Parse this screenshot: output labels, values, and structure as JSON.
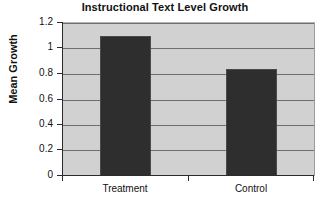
{
  "chart_data": {
    "type": "bar",
    "title": "Instructional Text Level Growth",
    "xlabel": "",
    "ylabel": "Mean Growth",
    "categories": [
      "Treatment",
      "Control"
    ],
    "values": [
      1.1,
      0.84
    ],
    "ylim": [
      0,
      1.2
    ],
    "ytick_labels": [
      "0",
      "0.2",
      "0.4",
      "0.6",
      "0.8",
      "1",
      "1.2"
    ],
    "ytick_values": [
      0,
      0.2,
      0.4,
      0.6,
      0.8,
      1,
      1.2
    ],
    "grid": true,
    "legend": "none",
    "colors": {
      "bar_fill": "#2e2e2e",
      "plot_background": "#d1d1d1",
      "gridline": "#6e6e6e",
      "axis": "#2b2b2b",
      "text": "#111111",
      "figure_background": "#ffffff"
    }
  }
}
